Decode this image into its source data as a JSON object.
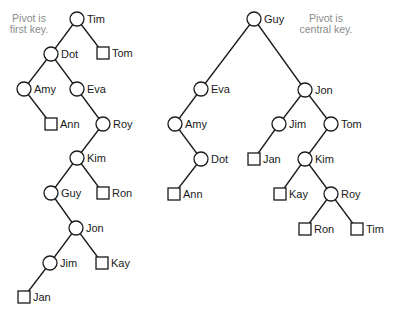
{
  "diagram": {
    "annotations": [
      {
        "id": "left-note",
        "lines": [
          "Pivot is",
          "first key."
        ],
        "x": 29,
        "y": 22
      },
      {
        "id": "right-note",
        "lines": [
          "Pivot is",
          "central key."
        ],
        "x": 326,
        "y": 22
      }
    ],
    "trees": [
      {
        "id": "left-tree",
        "description": "Pivot is first key",
        "nodes": [
          {
            "key": "Tim",
            "shape": "circle",
            "x": 77,
            "y": 19
          },
          {
            "key": "Dot",
            "shape": "circle",
            "x": 51,
            "y": 54
          },
          {
            "key": "Tom",
            "shape": "square",
            "x": 103,
            "y": 53
          },
          {
            "key": "Amy",
            "shape": "circle",
            "x": 24,
            "y": 89
          },
          {
            "key": "Eva",
            "shape": "circle",
            "x": 77,
            "y": 89
          },
          {
            "key": "Ann",
            "shape": "square",
            "x": 51,
            "y": 124
          },
          {
            "key": "Roy",
            "shape": "circle",
            "x": 103,
            "y": 124
          },
          {
            "key": "Kim",
            "shape": "circle",
            "x": 77,
            "y": 158
          },
          {
            "key": "Guy",
            "shape": "circle",
            "x": 51,
            "y": 193
          },
          {
            "key": "Ron",
            "shape": "square",
            "x": 103,
            "y": 193
          },
          {
            "key": "Jon",
            "shape": "circle",
            "x": 76,
            "y": 228
          },
          {
            "key": "Jim",
            "shape": "circle",
            "x": 50,
            "y": 263
          },
          {
            "key": "Kay",
            "shape": "square",
            "x": 102,
            "y": 263
          },
          {
            "key": "Jan",
            "shape": "square",
            "x": 24,
            "y": 297
          }
        ],
        "edges": [
          [
            "Tim",
            "Dot"
          ],
          [
            "Tim",
            "Tom"
          ],
          [
            "Dot",
            "Amy"
          ],
          [
            "Dot",
            "Eva"
          ],
          [
            "Amy",
            "Ann"
          ],
          [
            "Eva",
            "Roy"
          ],
          [
            "Roy",
            "Kim"
          ],
          [
            "Kim",
            "Guy"
          ],
          [
            "Kim",
            "Ron"
          ],
          [
            "Guy",
            "Jon"
          ],
          [
            "Jon",
            "Jim"
          ],
          [
            "Jon",
            "Kay"
          ],
          [
            "Jim",
            "Jan"
          ]
        ]
      },
      {
        "id": "right-tree",
        "description": "Pivot is central key",
        "nodes": [
          {
            "key": "Guy",
            "shape": "circle",
            "x": 254,
            "y": 19
          },
          {
            "key": "Eva",
            "shape": "circle",
            "x": 201,
            "y": 89
          },
          {
            "key": "Jon",
            "shape": "circle",
            "x": 305,
            "y": 90
          },
          {
            "key": "Amy",
            "shape": "circle",
            "x": 175,
            "y": 124
          },
          {
            "key": "Jim",
            "shape": "circle",
            "x": 279,
            "y": 124
          },
          {
            "key": "Tom",
            "shape": "circle",
            "x": 331,
            "y": 124
          },
          {
            "key": "Dot",
            "shape": "circle",
            "x": 201,
            "y": 159
          },
          {
            "key": "Jan",
            "shape": "square",
            "x": 254,
            "y": 159
          },
          {
            "key": "Kim",
            "shape": "circle",
            "x": 305,
            "y": 159
          },
          {
            "key": "Ann",
            "shape": "square",
            "x": 174,
            "y": 194
          },
          {
            "key": "Kay",
            "shape": "square",
            "x": 280,
            "y": 194
          },
          {
            "key": "Roy",
            "shape": "circle",
            "x": 331,
            "y": 194
          },
          {
            "key": "Ron",
            "shape": "square",
            "x": 305,
            "y": 229
          },
          {
            "key": "Tim",
            "shape": "square",
            "x": 357,
            "y": 229
          }
        ],
        "edges": [
          [
            "Guy",
            "Eva"
          ],
          [
            "Guy",
            "Jon"
          ],
          [
            "Eva",
            "Amy"
          ],
          [
            "Amy",
            "Dot"
          ],
          [
            "Dot",
            "Ann"
          ],
          [
            "Jon",
            "Jim"
          ],
          [
            "Jon",
            "Tom"
          ],
          [
            "Jim",
            "Jan"
          ],
          [
            "Tom",
            "Kim"
          ],
          [
            "Kim",
            "Kay"
          ],
          [
            "Kim",
            "Roy"
          ],
          [
            "Roy",
            "Ron"
          ],
          [
            "Roy",
            "Tim"
          ]
        ]
      }
    ],
    "style": {
      "node_radius": 7,
      "square_size": 12,
      "line_color": "#1a1a1a",
      "note_color": "#8a8a8a"
    }
  }
}
